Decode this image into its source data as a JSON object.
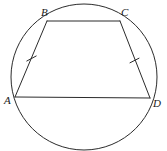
{
  "figure": {
    "name": "cyclic-quadrilateral-abcd",
    "canvas": {
      "width": 167,
      "height": 151,
      "background": "#ffffff"
    },
    "stroke_color": "#2b2b2b",
    "label_color": "#1a1a1a",
    "stroke_width": 1
  },
  "circle": {
    "name": "circumscribed-circle",
    "cx": 84,
    "cy": 77,
    "r": 73
  },
  "vertices": [
    {
      "id": "A",
      "label": "A",
      "x": 15,
      "y": 97,
      "label_x": 4,
      "label_y": 104
    },
    {
      "id": "B",
      "label": "B",
      "x": 47,
      "y": 21,
      "label_x": 41,
      "label_y": 16
    },
    {
      "id": "C",
      "label": "C",
      "x": 120,
      "y": 21,
      "label_x": 121,
      "label_y": 16
    },
    {
      "id": "D",
      "label": "D",
      "x": 150,
      "y": 98,
      "label_x": 153,
      "label_y": 107
    }
  ],
  "segments": [
    {
      "id": "AB",
      "name": "segment-ab",
      "x1": 15,
      "y1": 97,
      "x2": 47,
      "y2": 21,
      "ticks": 1
    },
    {
      "id": "BC",
      "name": "segment-bc",
      "x1": 47,
      "y1": 21,
      "x2": 120,
      "y2": 21,
      "ticks": 0
    },
    {
      "id": "CD",
      "name": "segment-cd",
      "x1": 120,
      "y1": 21,
      "x2": 150,
      "y2": 98,
      "ticks": 1
    },
    {
      "id": "AD",
      "name": "segment-ad",
      "x1": 15,
      "y1": 97,
      "x2": 150,
      "y2": 98,
      "ticks": 0
    }
  ],
  "tick_marks": [
    {
      "id": "tick-ab",
      "name": "congruence-tick-ab",
      "on": "AB",
      "cx": 31.5,
      "cy": 58.5,
      "x1": 26.8,
      "y1": 61.0,
      "x2": 36.2,
      "y2": 56.0
    },
    {
      "id": "tick-cd",
      "name": "congruence-tick-cd",
      "on": "CD",
      "cx": 134.5,
      "cy": 60.5,
      "x1": 130.0,
      "y1": 62.8,
      "x2": 139.0,
      "y2": 58.2
    }
  ]
}
